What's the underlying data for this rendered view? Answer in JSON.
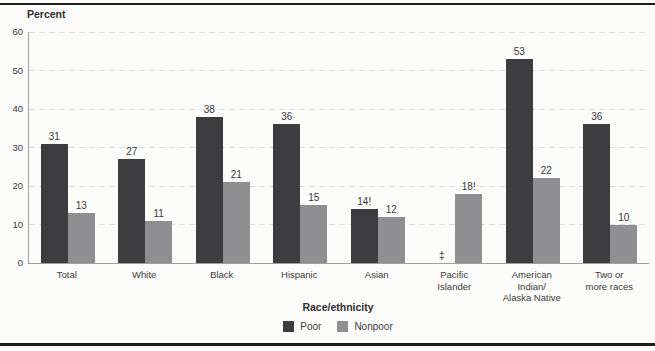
{
  "figure": {
    "background": "#fcfcfb",
    "rule_color": "#1d1d1d"
  },
  "chart_data": {
    "type": "bar",
    "title": "",
    "ylabel": "Percent",
    "xlabel": "Race/ethnicity",
    "ylim": [
      0,
      60
    ],
    "yticks": [
      0,
      10,
      20,
      30,
      40,
      50,
      60
    ],
    "grid": "dashed horizontal",
    "legend_position": "bottom center",
    "categories": [
      "Total",
      "White",
      "Black",
      "Hispanic",
      "Asian",
      "Pacific Islander",
      "American Indian/Alaska Native",
      "Two or more races"
    ],
    "category_label_lines": [
      [
        "Total"
      ],
      [
        "White"
      ],
      [
        "Black"
      ],
      [
        "Hispanic"
      ],
      [
        "Asian"
      ],
      [
        "Pacific",
        "Islander"
      ],
      [
        "American",
        "Indian/",
        "Alaska Native"
      ],
      [
        "Two or",
        "more races"
      ]
    ],
    "series": [
      {
        "name": "Poor",
        "color": "#3d3d3f",
        "values": [
          31,
          27,
          38,
          36,
          14,
          null,
          53,
          36
        ],
        "labels": [
          "31",
          "27",
          "38",
          "36",
          "14!",
          "‡",
          "53",
          "36"
        ]
      },
      {
        "name": "Nonpoor",
        "color": "#8f8f91",
        "values": [
          13,
          11,
          21,
          15,
          12,
          18,
          22,
          10
        ],
        "labels": [
          "13",
          "11",
          "21",
          "15",
          "12",
          "18!",
          "22",
          "10"
        ]
      }
    ],
    "suppressed_symbol": "‡"
  }
}
